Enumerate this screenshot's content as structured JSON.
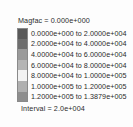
{
  "legend": {
    "magfac_label": "Magfac =  0.000e+000",
    "interval_label": "Interval =  2.0e+004",
    "to_word": "to"
  },
  "chart_data": {
    "type": "heatmap",
    "title": "Magfac =  0.000e+000",
    "subtitle": "Interval =  2.0e+004",
    "xlabel": "",
    "ylabel": "",
    "legend_position": "standalone-colorbar",
    "grid": false,
    "interval": 20000,
    "magfac": 0.0,
    "colormap": "grayscale-banded",
    "bands": [
      {
        "index": 0,
        "low": 0.0,
        "high": 20000.0,
        "low_label": "0.0000e+000",
        "high_label": "2.0000e+004",
        "color": "#595959"
      },
      {
        "index": 1,
        "low": 20000.0,
        "high": 40000.0,
        "low_label": "2.0000e+004",
        "high_label": "4.0000e+004",
        "color": "#6e6e6e"
      },
      {
        "index": 2,
        "low": 40000.0,
        "high": 60000.0,
        "low_label": "4.0000e+004",
        "high_label": "6.0000e+004",
        "color": "#9a9a9a"
      },
      {
        "index": 3,
        "low": 60000.0,
        "high": 80000.0,
        "low_label": "6.0000e+004",
        "high_label": "8.0000e+004",
        "color": "#b5b5b5"
      },
      {
        "index": 4,
        "low": 80000.0,
        "high": 100000.0,
        "low_label": "8.0000e+004",
        "high_label": "1.0000e+005",
        "color": "#f2f2f2"
      },
      {
        "index": 5,
        "low": 100000.0,
        "high": 120000.0,
        "low_label": "1.0000e+005",
        "high_label": "1.2000e+005",
        "color": "#b0b0b0"
      },
      {
        "index": 6,
        "low": 120000.0,
        "high": 138790.0,
        "low_label": "1.2000e+005",
        "high_label": "1.3879e+005",
        "color": "#8e8e8e"
      }
    ]
  }
}
